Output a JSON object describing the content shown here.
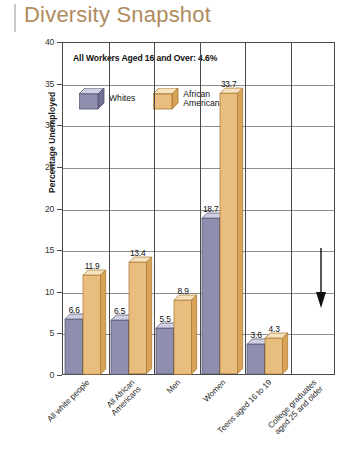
{
  "title": "Diversity Snapshot",
  "chart_data": {
    "type": "bar",
    "title": "Diversity Snapshot",
    "xlabel": "",
    "ylabel": "Percentage Unemployed",
    "ylim": [
      0,
      40
    ],
    "ytick_step": 5,
    "yticks": [
      "0",
      "5",
      "10",
      "15",
      "20",
      "25",
      "30",
      "35",
      "40"
    ],
    "grid": true,
    "legend_position": "top-left-inside",
    "annotation": "All Workers Aged 16 and Over: 4.6%",
    "categories": [
      "All white people",
      "All African\nAmericans",
      "Men",
      "Women",
      "Teens aged 16 to 19",
      "College graduates\naged 25 and older"
    ],
    "series": [
      {
        "name": "Whites",
        "color": "#8e8fae",
        "values": [
          6.6,
          null,
          6.5,
          5.5,
          18.7,
          3.6
        ]
      },
      {
        "name": "African Americans",
        "color": "#e9bd7d",
        "values": [
          null,
          11.9,
          13.4,
          8.9,
          33.7,
          4.3
        ]
      }
    ],
    "bars": [
      {
        "group": 0,
        "series": "Whites",
        "value": 6.6,
        "label": "6.6"
      },
      {
        "group": 0,
        "series": "African Americans",
        "value": 11.9,
        "label": "11.9"
      },
      {
        "group": 1,
        "series": "Whites",
        "value": 6.5,
        "label": "6.5"
      },
      {
        "group": 1,
        "series": "African Americans",
        "value": 13.4,
        "label": "13.4"
      },
      {
        "group": 2,
        "series": "Whites",
        "value": 5.5,
        "label": "5.5"
      },
      {
        "group": 2,
        "series": "African Americans",
        "value": 8.9,
        "label": "8.9"
      },
      {
        "group": 3,
        "series": "Whites",
        "value": 18.7,
        "label": "18.7"
      },
      {
        "group": 3,
        "series": "African Americans",
        "value": 33.7,
        "label": "33.7"
      },
      {
        "group": 4,
        "series": "Whites",
        "value": 3.6,
        "label": "3.6"
      },
      {
        "group": 4,
        "series": "African Americans",
        "value": 4.3,
        "label": "4.3"
      }
    ],
    "annotations": [
      {
        "type": "arrow",
        "direction": "down",
        "target": "College graduates aged 25 and older"
      }
    ]
  },
  "legend": {
    "items": [
      {
        "label": "Whites",
        "color": "#8e8fae",
        "icon": "cube-icon"
      },
      {
        "label": "African\nAmericans",
        "color": "#e9bd7d",
        "icon": "cube-icon"
      }
    ]
  },
  "colors": {
    "title": "#b08b5e",
    "whites_bar": "#8e8fae",
    "african_americans_bar": "#e9bd7d",
    "axis": "#4a4a4a",
    "gridline": "#8e8e8e"
  }
}
